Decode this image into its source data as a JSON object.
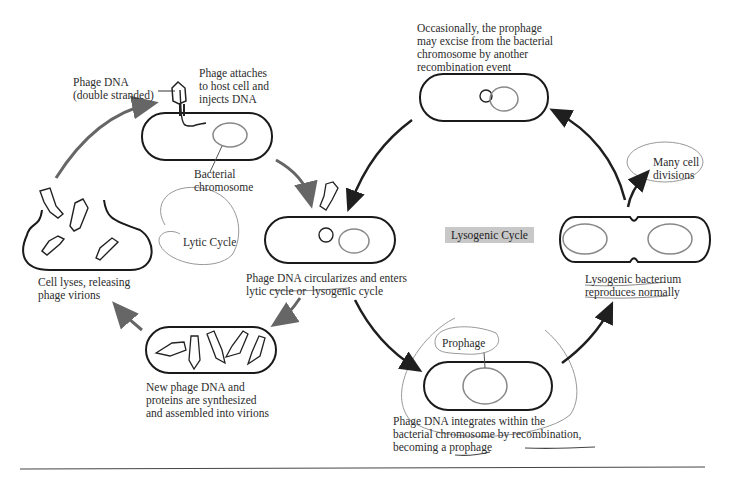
{
  "diagram": {
    "labels": {
      "phage_dna": "Phage DNA\n(double stranded)",
      "phage_attaches": "Phage attaches\nto host cell and\ninjects DNA",
      "bacterial_chromosome": "Bacterial\nchromosome",
      "cell_lyses": "Cell lyses, releasing\nphage virions",
      "lytic_cycle": "Lytic Cycle",
      "new_phage": "New phage DNA and\nproteins are synthesized\nand assembled into virions",
      "circularizes": "Phage DNA circularizes and enters\nlytic cycle or  lysogenic cycle",
      "lysogenic_cycle": "Lysogenic Cycle",
      "occasionally": "Occasionally, the prophage\nmay excise from the bacterial\nchromosome by another\nrecombination event",
      "many_divisions": "Many cell\ndivisions",
      "lysogenic_bacterium": "Lysogenic bacterium\nreproduces normally",
      "prophage": "Prophage",
      "integrates": "Phage DNA integrates within the\nbacterial chromosome by recombination,\nbecoming a prophage"
    },
    "colors": {
      "outline": "#1a1a1a",
      "chromosome": "#7a7a7a",
      "lytic_arrow": "#666666",
      "lysogenic_arrow": "#1f1f1f",
      "annotation": "#8a8a8a",
      "cycle_box": "#c8c8c8"
    }
  }
}
